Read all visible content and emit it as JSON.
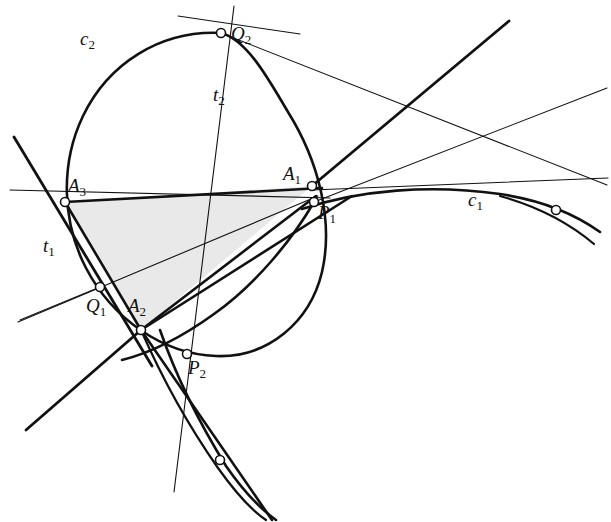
{
  "figure": {
    "width": 611,
    "height": 522,
    "background_color": "#ffffff",
    "stroke_color": "#111111",
    "shade_color": "#e9e9e9",
    "point_fill_color": "#ffffff"
  },
  "labels": [
    {
      "id": "c2",
      "base": "c",
      "sub": "2",
      "x": 80,
      "y": 45,
      "name": "label-c2"
    },
    {
      "id": "Q2",
      "base": "Q",
      "sub": "2",
      "x": 231,
      "y": 40,
      "name": "label-Q2"
    },
    {
      "id": "t2",
      "base": "t",
      "sub": "2",
      "x": 213,
      "y": 101,
      "name": "label-t2"
    },
    {
      "id": "A3",
      "base": "A",
      "sub": "3",
      "x": 68,
      "y": 192,
      "name": "label-A3"
    },
    {
      "id": "A1",
      "base": "A",
      "sub": "1",
      "x": 283,
      "y": 180,
      "name": "label-A1"
    },
    {
      "id": "P1",
      "base": "P",
      "sub": "1",
      "x": 318,
      "y": 219,
      "name": "label-P1"
    },
    {
      "id": "c1",
      "base": "c",
      "sub": "1",
      "x": 468,
      "y": 206,
      "name": "label-c1"
    },
    {
      "id": "t1",
      "base": "t",
      "sub": "1",
      "x": 43,
      "y": 252,
      "name": "label-t1"
    },
    {
      "id": "Q1",
      "base": "Q",
      "sub": "1",
      "x": 86,
      "y": 312,
      "name": "label-Q1"
    },
    {
      "id": "A2",
      "base": "A",
      "sub": "2",
      "x": 128,
      "y": 312,
      "name": "label-A2"
    },
    {
      "id": "P2",
      "base": "P",
      "sub": "2",
      "x": 188,
      "y": 374,
      "name": "label-P2"
    }
  ],
  "points": [
    {
      "id": "A1",
      "x": 312,
      "y": 186,
      "r": 4.5,
      "name": "point-A1"
    },
    {
      "id": "A2",
      "x": 141,
      "y": 330,
      "r": 4.5,
      "name": "point-A2"
    },
    {
      "id": "A3",
      "x": 65,
      "y": 202,
      "r": 4.5,
      "name": "point-A3"
    },
    {
      "id": "P1",
      "x": 314,
      "y": 202,
      "r": 4.5,
      "name": "point-P1"
    },
    {
      "id": "P2",
      "x": 187,
      "y": 354,
      "r": 4.5,
      "name": "point-P2"
    },
    {
      "id": "Q1",
      "x": 100,
      "y": 287,
      "r": 4.5,
      "name": "point-Q1"
    },
    {
      "id": "Q2",
      "x": 221,
      "y": 33,
      "r": 4.5,
      "name": "point-Q2"
    },
    {
      "id": "F1",
      "x": 556,
      "y": 210,
      "r": 4.5,
      "name": "point-free-on-c1"
    },
    {
      "id": "F2",
      "x": 220,
      "y": 460,
      "r": 4.5,
      "name": "point-free-on-c2-branch"
    }
  ],
  "triangle": {
    "name": "shaded-triangle-A1A2A3",
    "vertices": [
      [
        312,
        186
      ],
      [
        141,
        330
      ],
      [
        65,
        202
      ]
    ],
    "fill": "#e9e9e9"
  },
  "conics": [
    {
      "id": "c1",
      "name": "conic-c1",
      "kind": "shallow-arc",
      "width": 2.6,
      "path": "M 302 209 C 360 190 430 184 500 194 C 540 200 575 214 600 232"
    },
    {
      "id": "c2",
      "name": "conic-c2-oval",
      "kind": "oval",
      "width": 2.6,
      "path": "M 221 33 C 160 30 108 64 83 116 C 60 164 62 222 86 268 C 112 318 162 354 216 356 C 268 358 310 322 322 272 C 334 220 318 160 288 112 C 270 82 248 40 221 33 Z"
    },
    {
      "id": "c2-inner",
      "name": "inscribed-conic-branch",
      "kind": "arc",
      "width": 2.6,
      "path": "M 314 202 C 292 240 256 284 214 314 C 178 340 146 354 122 360"
    },
    {
      "id": "c2-tail",
      "name": "conic-lower-branch",
      "kind": "arc",
      "width": 2.6,
      "path": "M 160 330 C 176 376 200 424 226 466 C 244 492 262 510 276 520"
    },
    {
      "id": "c2-tail-b",
      "name": "conic-lower-branch-b",
      "kind": "arc",
      "width": 2.2,
      "path": "M 141 330 C 162 378 190 428 218 468 C 238 496 254 512 266 520"
    },
    {
      "id": "c1-tail",
      "name": "conic-c1-lower-tail",
      "kind": "arc",
      "width": 2.2,
      "path": "M 500 196 C 536 206 568 222 594 244"
    }
  ],
  "lines": [
    {
      "id": "side-A3A1",
      "name": "triangle-side-A3-A1",
      "x1": 65,
      "y1": 202,
      "x2": 322,
      "y2": 188,
      "width": 2.6
    },
    {
      "id": "side-A3A2",
      "name": "triangle-side-A3-A2",
      "x1": 65,
      "y1": 202,
      "x2": 141,
      "y2": 330,
      "width": 2.6
    },
    {
      "id": "side-A2A1",
      "name": "triangle-side-A2-A1",
      "x1": 141,
      "y1": 330,
      "x2": 316,
      "y2": 196,
      "width": 2.6
    },
    {
      "id": "ray-A3-up",
      "name": "thick-ray-through-A3-upper-left",
      "x1": 14,
      "y1": 137,
      "x2": 152,
      "y2": 366,
      "width": 2.8
    },
    {
      "id": "ray-A2-lower-left",
      "name": "thick-ray-A2-lower-left",
      "x1": 141,
      "y1": 330,
      "x2": 26,
      "y2": 430,
      "width": 2.8
    },
    {
      "id": "ray-A1-upper-right",
      "name": "thick-ray-A1-upper-right",
      "x1": 312,
      "y1": 186,
      "x2": 509,
      "y2": 21,
      "width": 2.8
    },
    {
      "id": "ray-A2-P1-ext",
      "name": "thick-ray-A2-through-P1-extended",
      "x1": 141,
      "y1": 330,
      "x2": 352,
      "y2": 196,
      "width": 2.6
    },
    {
      "id": "ray-P2-down",
      "name": "thick-ray-through-P2-downward",
      "x1": 141,
      "y1": 330,
      "x2": 272,
      "y2": 520,
      "width": 2.6
    },
    {
      "id": "t1",
      "name": "tangent-line-t1",
      "x1": 10,
      "y1": 190,
      "x2": 330,
      "y2": 198,
      "width": 1.1
    },
    {
      "id": "t1b",
      "name": "tangent-line-t1-thin-diagonal",
      "x1": 18,
      "y1": 322,
      "x2": 318,
      "y2": 196,
      "width": 1.1
    },
    {
      "id": "t2",
      "name": "tangent-line-t2",
      "x1": 234,
      "y1": 6,
      "x2": 174,
      "y2": 492,
      "width": 1.1
    },
    {
      "id": "secant-Q2-right",
      "name": "thin-secant-from-Q2-to-right",
      "x1": 221,
      "y1": 33,
      "x2": 607,
      "y2": 185,
      "width": 1.1
    },
    {
      "id": "secant-upper-left",
      "name": "thin-secant-upper-left-to-right",
      "x1": 178,
      "y1": 16,
      "x2": 300,
      "y2": 34,
      "width": 1.1
    },
    {
      "id": "secant-P1-right",
      "name": "thin-secant-P1-to-upper-right",
      "x1": 314,
      "y1": 202,
      "x2": 607,
      "y2": 88,
      "width": 1.1
    },
    {
      "id": "secant-A1-right",
      "name": "thin-secant-A1-far-right",
      "x1": 312,
      "y1": 190,
      "x2": 608,
      "y2": 178,
      "width": 1.1
    },
    {
      "id": "secant-Q1-left",
      "name": "thin-secant-Q1-to-left",
      "x1": 100,
      "y1": 287,
      "x2": 20,
      "y2": 320,
      "width": 1.1
    }
  ]
}
